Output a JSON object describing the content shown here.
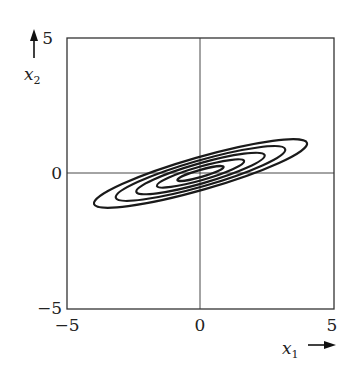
{
  "chart_data": {
    "type": "contour",
    "title": "",
    "xlabel": "x1",
    "ylabel": "x2",
    "xlim": [
      -5,
      5
    ],
    "ylim": [
      -5,
      5
    ],
    "x_ticks": [
      "-5",
      "0",
      "5"
    ],
    "y_ticks": [
      "-5",
      "0",
      "5"
    ],
    "grid": false,
    "axes_lines": {
      "x0": true,
      "y0": true
    },
    "contours": {
      "center": [
        0,
        0
      ],
      "count": 5,
      "rotation_deg": 16,
      "semi_major": [
        0.9,
        1.7,
        2.5,
        3.3,
        4.15
      ],
      "semi_minor": [
        0.13,
        0.25,
        0.37,
        0.48,
        0.6
      ]
    }
  },
  "labels": {
    "x_tick_min": "−5",
    "x_tick_mid": "0",
    "x_tick_max": "5",
    "y_tick_min": "−5",
    "y_tick_mid": "0",
    "y_tick_max": "5",
    "x_axis_var": "x",
    "x_axis_sub": "1",
    "y_axis_var": "x",
    "y_axis_sub": "2"
  }
}
